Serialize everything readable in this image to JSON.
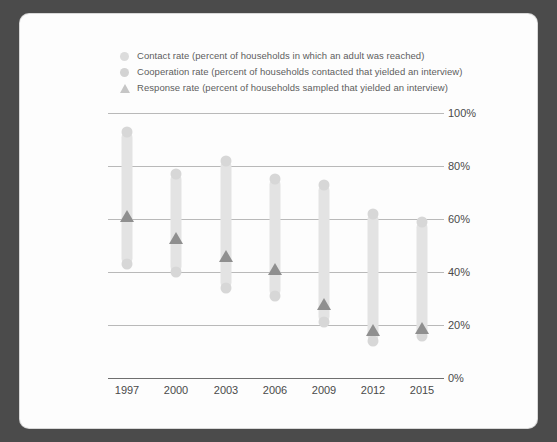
{
  "legend": {
    "items": [
      {
        "marker": "circle-marker",
        "label": "Contact rate (percent of households in which an adult was reached)"
      },
      {
        "marker": "circle-marker",
        "label": "Cooperation rate (percent of households contacted that yielded an interview)"
      },
      {
        "marker": "triangle-marker",
        "label": "Response rate (percent of households sampled that yielded an interview)"
      }
    ]
  },
  "axes": {
    "y_ticks": [
      "100%",
      "80%",
      "60%",
      "40%",
      "20%",
      "0%"
    ],
    "x_ticks": [
      "1997",
      "2000",
      "2003",
      "2006",
      "2009",
      "2012",
      "2015"
    ]
  },
  "colors": {
    "page_background": "#4b4b4b",
    "card_background": "#fdfdfd",
    "bar": "#e3e3e3",
    "dot": "#d7d7d7",
    "triangle": "#8f8f8f",
    "gridline": "#b9b9b9",
    "axis": "#6f6f6f",
    "text": "#4a4a4a"
  },
  "chart_data": {
    "type": "line",
    "title": "",
    "xlabel": "",
    "ylabel": "",
    "ylim": [
      0,
      100
    ],
    "grid": true,
    "legend_position": "top-left",
    "categories": [
      "1997",
      "2000",
      "2003",
      "2006",
      "2009",
      "2012",
      "2015"
    ],
    "series": [
      {
        "name": "Contact rate (percent of households in which an adult was reached)",
        "marker": "circle",
        "values": [
          93,
          77,
          82,
          75,
          73,
          62,
          59
        ]
      },
      {
        "name": "Cooperation rate (percent of households contacted that yielded an interview)",
        "marker": "circle",
        "values": [
          43,
          40,
          34,
          31,
          21,
          14,
          16
        ]
      },
      {
        "name": "Response rate (percent of households sampled that yielded an interview)",
        "marker": "triangle",
        "values": [
          61,
          53,
          46,
          41,
          28,
          18,
          19
        ]
      }
    ]
  }
}
